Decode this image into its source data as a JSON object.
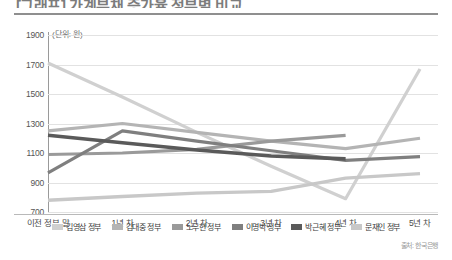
{
  "headline": "[그래프] 가계부채 증가율 정부별 비교",
  "unit_note": "(단위: 원)",
  "source": "출처: 한국은행",
  "axis": {
    "y_ticks": [
      "1900",
      "1700",
      "1500",
      "1300",
      "1100",
      "900",
      "700"
    ],
    "x_ticks": [
      "이전 정부 말",
      "1년 차",
      "2년 차",
      "3년 차",
      "4년 차",
      "5년 차"
    ]
  },
  "legend": [
    {
      "label": "김영삼 정부",
      "color": "#d0d0d0"
    },
    {
      "label": "김대중 정부",
      "color": "#b4b4b4"
    },
    {
      "label": "노무현 정부",
      "color": "#9a9a9a"
    },
    {
      "label": "이명박 정부",
      "color": "#7f7f7f"
    },
    {
      "label": "박근혜 정부",
      "color": "#5a5a5a"
    },
    {
      "label": "문재인 정부",
      "color": "#c8c8c8"
    }
  ],
  "chart_data": {
    "type": "line",
    "title": "[그래프] 가계부채 증가율 정부별 비교",
    "xlabel": "",
    "ylabel": "(단위: 원)",
    "ylim": [
      700,
      1900
    ],
    "ytick_step": 200,
    "grid": true,
    "legend_position": "bottom",
    "categories": [
      "이전 정부 말",
      "1년 차",
      "2년 차",
      "3년 차",
      "4년 차",
      "5년 차"
    ],
    "series": [
      {
        "name": "김영삼 정부",
        "color": "#d0d0d0",
        "width": 3.2,
        "values": [
          1710,
          1480,
          1240,
          1010,
          790,
          1670
        ]
      },
      {
        "name": "김대중 정부",
        "color": "#b4b4b4",
        "width": 3.2,
        "values": [
          1250,
          1300,
          1240,
          1180,
          1130,
          1200
        ]
      },
      {
        "name": "노무현 정부",
        "color": "#9a9a9a",
        "width": 3.2,
        "values": [
          1090,
          1100,
          1125,
          1180,
          1220,
          null
        ]
      },
      {
        "name": "이명박 정부",
        "color": "#7f7f7f",
        "width": 3.2,
        "values": [
          965,
          1250,
          1180,
          1115,
          1050,
          1075
        ]
      },
      {
        "name": "박근혜 정부",
        "color": "#5a5a5a",
        "width": 3.6,
        "values": [
          1220,
          1170,
          1120,
          1080,
          1060,
          null
        ]
      },
      {
        "name": "문재인 정부",
        "color": "#c8c8c8",
        "width": 3.4,
        "values": [
          780,
          805,
          828,
          840,
          930,
          960
        ]
      }
    ]
  }
}
